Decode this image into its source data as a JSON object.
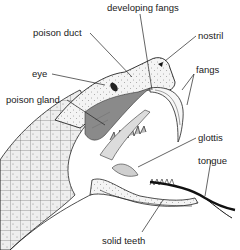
{
  "diagram": {
    "labels": {
      "developing_fangs": "developing fangs",
      "poison_duct": "poison duct",
      "nostril": "nostril",
      "eye": "eye",
      "fangs": "fangs",
      "poison_gland": "poison gland",
      "glottis": "glottis",
      "tongue": "tongue",
      "solid_teeth": "solid teeth"
    },
    "colors": {
      "ink": "#1a1a1a",
      "gland_fill": "#8a8a8a",
      "skin_fill": "#e6e6e6",
      "background": "#ffffff"
    }
  }
}
